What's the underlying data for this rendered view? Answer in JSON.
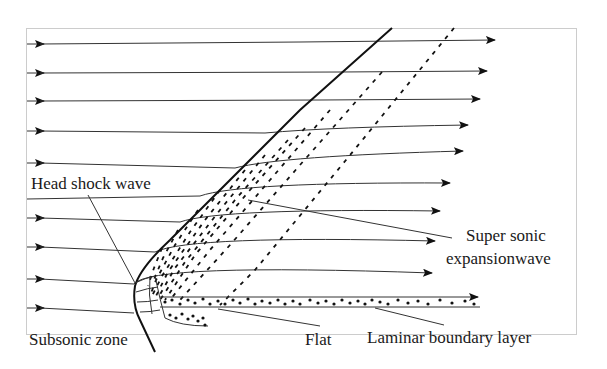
{
  "diagram": {
    "labels": {
      "head_shock": "Head shock wave",
      "expansion_line1": "Super sonic",
      "expansion_line2": "expansionwave",
      "subsonic": "Subsonic zone",
      "flat": "Flat",
      "boundary": "Laminar boundary layer"
    },
    "colors": {
      "line": "#111111",
      "frame": "#cccccc",
      "background": "#ffffff"
    }
  }
}
